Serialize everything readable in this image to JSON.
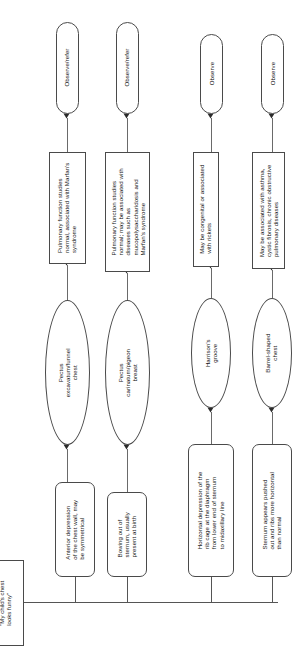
{
  "diagram": {
    "title": "My child's chest looks funny",
    "orientation": "rotated-90",
    "root": {
      "label": "\"My child's chest\nlooks funny\""
    },
    "branches": [
      {
        "id": "pectus-excavatum",
        "symptom": "Anterior depression\nof the chest wall, may\nbe symmetrical",
        "diagnosis": "Pectus\nexcavatum/funnel\nchest",
        "note": "Pulmonary function studies\nnormal, associated with Marfan's\nsyndrome",
        "action": "Observe/refer"
      },
      {
        "id": "pectus-carinatum",
        "symptom": "Bowing out of\nsternum, usually\npresent at birth",
        "diagnosis": "Pectus\ncarinatum/pigeon\nbreast",
        "note": "Pulmonary function studies\nnormal; may be associated with\ndiseases such as\nmucopolysaccharidosis and\nMarfan's syndrome",
        "action": "Observe/refer"
      },
      {
        "id": "harrisons-groove",
        "symptom": "Horizontal depression of the\nrib cage at the diaphragm\nfrom lower end of sternum\nto midaxillary line",
        "diagnosis": "Harrison's\ngroove",
        "note": "May be congenital or associated\nwith rickets",
        "action": "Observe"
      },
      {
        "id": "barrel-chest",
        "symptom": "Sternum appears pushed\nout and ribs more horizontal\nthan normal",
        "diagnosis": "Barrel-shaped\nchest",
        "note": "May be associated with asthma,\ncystic fibrosis, chronic obstructive\npulmonary diseases",
        "action": "Observe"
      }
    ],
    "colors": {
      "stroke": "#4a4a4a",
      "connector": "#6a6a6a",
      "arrow": "#2b2b2b",
      "background": "#ffffff",
      "text": "#161616"
    }
  }
}
